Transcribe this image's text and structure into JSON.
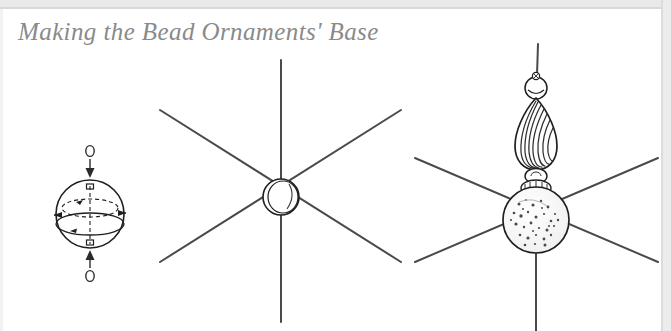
{
  "page": {
    "title": "Making the Bead Ornaments' Base",
    "background_color": "#ffffff",
    "title_color": "#8a8a8a",
    "ink_color": "#4d4d4d",
    "edge_color": "#e9e9e9"
  },
  "figures": [
    {
      "id": "sphere-threading-diagram",
      "name": "bead-threading-diagram",
      "description": "Round bead shown in perspective with dashed vertical axis and equator, wire ends entering from top and bottom",
      "elements": [
        "wire-loop-top",
        "arrow-down",
        "bead-sphere",
        "dashed-axis",
        "dashed-equator",
        "arrow-up",
        "wire-loop-bottom"
      ]
    },
    {
      "id": "six-arm-star-diagram",
      "name": "six-arm-wire-star",
      "description": "Six wires radiating from a central ring bead forming a star base",
      "arm_count": 6,
      "center_element": "ring-bead"
    },
    {
      "id": "beaded-star-diagram",
      "name": "beaded-star-assembly",
      "description": "Star base with beads strung on the top wire: small ring bead, swirled teardrop bead, spacer bead and large speckled round bead at the center",
      "arm_count": 6,
      "beads": [
        "small-ring-bead",
        "teardrop-swirl-bead",
        "spacer-bead",
        "large-speckled-bead"
      ]
    }
  ]
}
